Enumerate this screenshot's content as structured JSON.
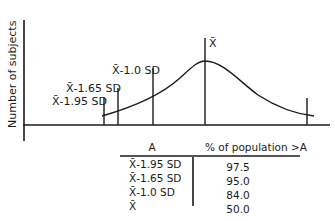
{
  "figure": {
    "y_axis_label": "Number of subjects",
    "markers": [
      {
        "label": "X̄-1.95 SD",
        "x": 104
      },
      {
        "label": "X̄-1.65 SD",
        "x": 118
      },
      {
        "label": "X̄-1.0 SD",
        "x": 153
      },
      {
        "label": "X̄",
        "x": 205
      }
    ],
    "curve": "normal-distribution-bell-curve"
  },
  "table": {
    "headers": [
      "A",
      "% of population >A"
    ],
    "rows": [
      {
        "a": "X̄-1.95 SD",
        "pct": "97.5"
      },
      {
        "a": "X̄-1.65 SD",
        "pct": "95.0"
      },
      {
        "a": "X̄-1.0 SD",
        "pct": "84.0"
      },
      {
        "a": "X̄",
        "pct": "50.0"
      }
    ]
  }
}
